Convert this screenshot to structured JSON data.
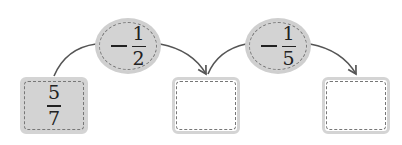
{
  "diagram": {
    "type": "operation-chain",
    "start": {
      "numerator": "5",
      "denominator": "7"
    },
    "operations": [
      {
        "sign": "−",
        "numerator": "1",
        "denominator": "2"
      },
      {
        "sign": "−",
        "numerator": "1",
        "denominator": "5"
      }
    ],
    "results": [
      "",
      ""
    ],
    "colors": {
      "fill": "#d3d3d3",
      "dash": "#777777",
      "arrow": "#555555"
    }
  }
}
